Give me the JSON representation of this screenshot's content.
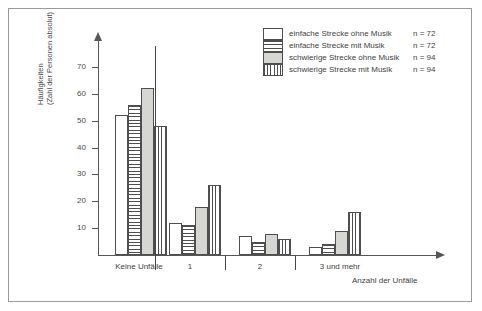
{
  "chart_data": {
    "type": "bar",
    "title": "",
    "xlabel": "Anzahl der Unfälle",
    "ylabel": "Häufigkeiten (Zahl der Personen absolut)",
    "ylabel_line1": "Häufigkeiten",
    "ylabel_line2": "(Zahl der Personen absolut)",
    "categories": [
      "Keine Unfälle",
      "1",
      "2",
      "3 und mehr"
    ],
    "yticks": [
      10,
      20,
      30,
      40,
      50,
      60,
      70
    ],
    "ylim": [
      0,
      80
    ],
    "grid": false,
    "legend_position": "top-right",
    "series": [
      {
        "name": "einfache Strecke ohne Musik",
        "n": "n = 72",
        "pattern": "plain-white",
        "values": [
          52,
          12,
          7,
          3
        ]
      },
      {
        "name": "einfache Strecke mit Musik",
        "n": "n = 72",
        "pattern": "horizontal-hatch",
        "values": [
          56,
          11,
          5,
          4
        ]
      },
      {
        "name": "schwierige Strecke ohne Musik",
        "n": "n = 94",
        "pattern": "solid-gray",
        "values": [
          62,
          18,
          8,
          9
        ]
      },
      {
        "name": "schwierige Strecke mit Musik",
        "n": "n = 94",
        "pattern": "vertical-hatch",
        "values": [
          48,
          26,
          6,
          16
        ]
      }
    ]
  },
  "axis": {
    "ytick_labels": [
      "70",
      "60",
      "50",
      "40",
      "30",
      "20",
      "10"
    ],
    "x_title": "Anzahl der Unfälle"
  },
  "legend": {
    "items": [
      {
        "label": "einfache Strecke ohne Musik",
        "n": "n = 72"
      },
      {
        "label": "einfache Strecke mit Musik",
        "n": "n = 72"
      },
      {
        "label": "schwierige Strecke ohne Musik",
        "n": "n = 94"
      },
      {
        "label": "schwierige Strecke mit Musik",
        "n": "n = 94"
      }
    ]
  },
  "categories": [
    {
      "label": "Keine Unfälle"
    },
    {
      "label": "1"
    },
    {
      "label": "2"
    },
    {
      "label": "3 und mehr"
    }
  ]
}
